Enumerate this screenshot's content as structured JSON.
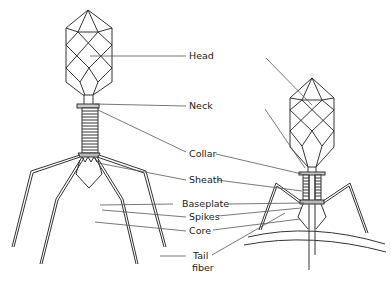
{
  "diagram": {
    "labels": [
      {
        "id": "head",
        "text": "Head"
      },
      {
        "id": "neck",
        "text": "Neck"
      },
      {
        "id": "collar",
        "text": "Collar"
      },
      {
        "id": "sheath",
        "text": "Sheath"
      },
      {
        "id": "baseplate",
        "text": "Baseplate"
      },
      {
        "id": "spikes",
        "text": "Spikes"
      },
      {
        "id": "core",
        "text": "Core"
      },
      {
        "id": "tail_fiber_1",
        "text": "Tail"
      },
      {
        "id": "tail_fiber_2",
        "text": "fiber"
      }
    ]
  }
}
